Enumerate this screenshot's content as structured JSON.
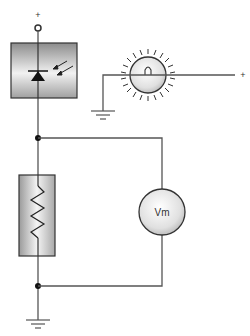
{
  "diagram": {
    "labels": {
      "top_supply": "+",
      "lamp_supply": "+",
      "voltmeter": "Vm"
    },
    "components": [
      {
        "id": "photodiode",
        "type": "photodiode-in-housing"
      },
      {
        "id": "lamp",
        "type": "light-bulb"
      },
      {
        "id": "resistor",
        "type": "load-resistor"
      },
      {
        "id": "voltmeter",
        "type": "voltmeter",
        "label": "Vm"
      },
      {
        "id": "ground-main",
        "type": "ground"
      },
      {
        "id": "ground-lamp",
        "type": "ground"
      }
    ],
    "colors": {
      "wire": "#555555",
      "outline": "#333333",
      "box_fill_dark": "#8a8a8a",
      "box_fill_light": "#f4f4f4",
      "junction": "#111111"
    }
  }
}
